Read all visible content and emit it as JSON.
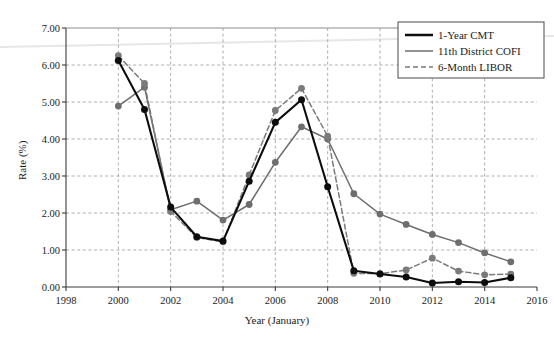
{
  "chart_data": {
    "type": "line",
    "title": "",
    "xlabel": "Year (January)",
    "ylabel": "Rate (%)",
    "xlim": [
      1998,
      2016
    ],
    "ylim": [
      0.0,
      7.0
    ],
    "xticks": [
      "1998",
      "2000",
      "2002",
      "2004",
      "2006",
      "2008",
      "2010",
      "2012",
      "2014",
      "2016"
    ],
    "yticks": [
      "0.00",
      "1.00",
      "2.00",
      "3.00",
      "4.00",
      "5.00",
      "6.00",
      "7.00"
    ],
    "grid": true,
    "legend_position": "top-right",
    "x": [
      2000,
      2001,
      2002,
      2003,
      2004,
      2005,
      2006,
      2007,
      2008,
      2009,
      2010,
      2011,
      2012,
      2013,
      2014,
      2015
    ],
    "series": [
      {
        "name": "1-Year CMT",
        "color": "#0d0d0d",
        "style": "solid",
        "width": 2.1,
        "marker": "circle",
        "values": [
          6.12,
          4.8,
          2.16,
          1.36,
          1.24,
          2.86,
          4.45,
          5.06,
          2.71,
          0.44,
          0.35,
          0.27,
          0.11,
          0.14,
          0.12,
          0.25
        ]
      },
      {
        "name": "11th District COFI",
        "color": "#6e6e6e",
        "style": "solid",
        "width": 1.5,
        "marker": "circle",
        "values": [
          4.89,
          5.4,
          2.09,
          2.32,
          1.81,
          2.23,
          3.37,
          4.33,
          4.0,
          2.52,
          1.97,
          1.69,
          1.42,
          1.2,
          0.92,
          0.68
        ]
      },
      {
        "name": "6-Month LIBOR",
        "color": "#7a7a7a",
        "style": "dashed",
        "width": 1.5,
        "marker": "circle",
        "values": [
          6.25,
          5.5,
          2.04,
          1.34,
          1.22,
          3.03,
          4.77,
          5.37,
          4.08,
          0.37,
          0.36,
          0.46,
          0.78,
          0.43,
          0.33,
          0.35
        ]
      }
    ]
  },
  "legend": {
    "entries": [
      {
        "label": "1-Year CMT"
      },
      {
        "label": "11th District COFI"
      },
      {
        "label": "6-Month LIBOR"
      }
    ]
  },
  "colors": {
    "cmt": "#0d0d0d",
    "cofi": "#6e6e6e",
    "libor": "#7a7a7a",
    "grid": "#9a9a9a",
    "axis": "#3a3a3a",
    "background": "#ffffff"
  }
}
